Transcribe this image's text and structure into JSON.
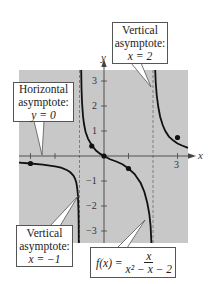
{
  "figure": {
    "function_label": {
      "lhs": "f(x) =",
      "numerator": "x",
      "denominator": "x² − x − 2"
    },
    "axes": {
      "x_label": "x",
      "y_label": "y",
      "x_ticks": [
        -3,
        -2,
        -1,
        1,
        2,
        3
      ],
      "x_tick_labels_shown": [
        "3"
      ],
      "y_ticks": [
        -3,
        -2,
        -1,
        1,
        2,
        3
      ],
      "y_tick_labels": [
        "3",
        "2",
        "1",
        "−1",
        "−2",
        "−3"
      ]
    },
    "callouts": {
      "vertical_right": {
        "line1": "Vertical",
        "line2": "asymptote:",
        "line3": "x = 2"
      },
      "horizontal": {
        "line1": "Horizontal",
        "line2": "asymptote:",
        "line3": "y = 0"
      },
      "vertical_left": {
        "line1": "Vertical",
        "line2": "asymptote:",
        "line3": "x = −1"
      }
    },
    "colors": {
      "plot_background": "#c8c8c8",
      "curve": "#111111",
      "asymptote": "#666666",
      "axis": "#444444"
    },
    "points": [
      {
        "x": -3,
        "y": -0.3
      },
      {
        "x": -0.5,
        "y": 0.4
      },
      {
        "x": 0,
        "y": 0
      },
      {
        "x": 1,
        "y": -0.5
      },
      {
        "x": 3,
        "y": 0.75
      }
    ],
    "asymptotes": {
      "vertical": [
        -1,
        2
      ],
      "horizontal": 0
    }
  }
}
